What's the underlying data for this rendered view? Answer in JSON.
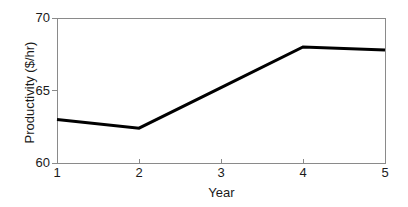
{
  "chart_data": {
    "type": "line",
    "title": "",
    "xlabel": "Year",
    "ylabel": "Productivity ($/hr)",
    "x": [
      1,
      2,
      3,
      4,
      5
    ],
    "categories": [
      "1",
      "2",
      "3",
      "4",
      "5"
    ],
    "values": [
      63.0,
      62.4,
      65.2,
      68.0,
      67.8
    ],
    "series": [
      {
        "name": "Productivity",
        "values": [
          63.0,
          62.4,
          65.2,
          68.0,
          67.8
        ],
        "color": "#000000",
        "line_width": 3,
        "markers": false
      }
    ],
    "xlim": [
      1,
      5
    ],
    "ylim": [
      60,
      70
    ],
    "xticks": [
      1,
      2,
      3,
      4,
      5
    ],
    "yticks": [
      60,
      65,
      70
    ],
    "xticklabels": [
      "1",
      "2",
      "3",
      "4",
      "5"
    ],
    "yticklabels": [
      "60",
      "65",
      "70"
    ],
    "grid": false,
    "legend": null,
    "legend_position": "none",
    "annotations": [],
    "axis_color": "#8a8a8a",
    "background_color": "#ffffff",
    "text_color": "#1a1a1a"
  },
  "axes": {
    "y_tick_labels": [
      "70",
      "65",
      "60"
    ],
    "x_tick_labels": [
      "1",
      "2",
      "3",
      "4",
      "5"
    ],
    "y_title": "Productivity ($/hr)",
    "x_title": "Year"
  }
}
